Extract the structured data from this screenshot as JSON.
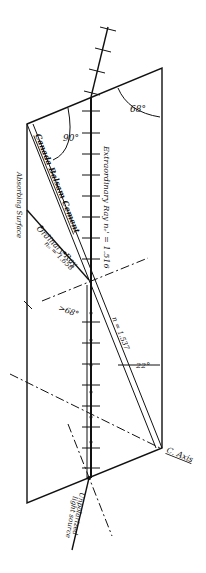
{
  "diagram": {
    "colors": {
      "ink": "#111111",
      "paper": "#ffffff"
    },
    "labels": {
      "extraordinary_ray": "Extraordinary Ray  nₑ' = 1.516",
      "canada_balsam": "Canada Balsam Cement",
      "absorbing_surface": "Absorbing Surface",
      "ordinary_ray_line1": "Ordinary Ray",
      "ordinary_ray_line2": "nₒ = 1.658",
      "balsam_index": "n = 1.537",
      "angle_68": "68°",
      "angle_90": "90°",
      "angle_gt68": ">68°",
      "angle_22": "22°",
      "c_axis": "C. Axis",
      "light_source_line1": "Unpolarized",
      "light_source_line2": "light source"
    }
  }
}
